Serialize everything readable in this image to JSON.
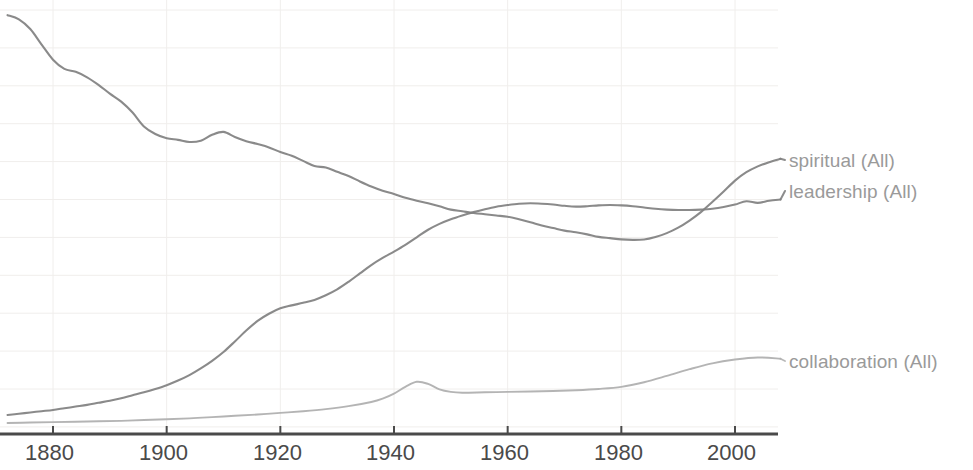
{
  "chart_data": {
    "type": "line",
    "title": "",
    "xlabel": "",
    "ylabel": "",
    "grid": true,
    "legend_position": "right-inline",
    "xlim": [
      1872,
      2008
    ],
    "ylim": [
      0,
      1.0
    ],
    "xticks": [
      "1880",
      "1900",
      "1920",
      "1940",
      "1960",
      "1980",
      "2000"
    ],
    "xtick_values": [
      1880,
      1900,
      1920,
      1940,
      1960,
      1980,
      2000
    ],
    "yticks": [],
    "series": [
      {
        "name": "spiritual (All)",
        "label": "spiritual (All)",
        "color": "#808080",
        "x": [
          1872,
          1874,
          1876,
          1878,
          1880,
          1882,
          1884,
          1886,
          1888,
          1890,
          1892,
          1894,
          1896,
          1898,
          1900,
          1902,
          1904,
          1906,
          1908,
          1910,
          1912,
          1914,
          1916,
          1918,
          1920,
          1922,
          1924,
          1926,
          1928,
          1930,
          1932,
          1934,
          1936,
          1938,
          1940,
          1942,
          1944,
          1946,
          1948,
          1950,
          1952,
          1954,
          1956,
          1958,
          1960,
          1962,
          1964,
          1966,
          1968,
          1970,
          1972,
          1974,
          1976,
          1978,
          1980,
          1982,
          1984,
          1986,
          1988,
          1990,
          1992,
          1994,
          1996,
          1998,
          2000,
          2002,
          2004,
          2006,
          2008
        ],
        "y": [
          0.983,
          0.973,
          0.95,
          0.913,
          0.877,
          0.855,
          0.848,
          0.835,
          0.817,
          0.796,
          0.777,
          0.751,
          0.718,
          0.7,
          0.69,
          0.686,
          0.681,
          0.684,
          0.698,
          0.705,
          0.693,
          0.683,
          0.676,
          0.668,
          0.657,
          0.648,
          0.636,
          0.624,
          0.62,
          0.61,
          0.6,
          0.587,
          0.575,
          0.565,
          0.557,
          0.548,
          0.541,
          0.535,
          0.528,
          0.52,
          0.516,
          0.512,
          0.509,
          0.506,
          0.503,
          0.497,
          0.49,
          0.482,
          0.476,
          0.47,
          0.466,
          0.461,
          0.455,
          0.452,
          0.449,
          0.448,
          0.449,
          0.455,
          0.464,
          0.477,
          0.494,
          0.514,
          0.538,
          0.563,
          0.589,
          0.609,
          0.623,
          0.633,
          0.641
        ]
      },
      {
        "name": "leadership (All)",
        "label": "leadership (All)",
        "color": "#808080",
        "x": [
          1872,
          1874,
          1876,
          1878,
          1880,
          1882,
          1884,
          1886,
          1888,
          1890,
          1892,
          1894,
          1896,
          1898,
          1900,
          1902,
          1904,
          1906,
          1908,
          1910,
          1912,
          1914,
          1916,
          1918,
          1920,
          1922,
          1924,
          1926,
          1928,
          1930,
          1932,
          1934,
          1936,
          1938,
          1940,
          1942,
          1944,
          1946,
          1948,
          1950,
          1952,
          1954,
          1956,
          1958,
          1960,
          1962,
          1964,
          1966,
          1968,
          1970,
          1972,
          1974,
          1976,
          1978,
          1980,
          1982,
          1984,
          1986,
          1988,
          1990,
          1992,
          1994,
          1996,
          1998,
          2000,
          2002,
          2004,
          2006,
          2008
        ],
        "y": [
          0.031,
          0.034,
          0.037,
          0.04,
          0.043,
          0.047,
          0.051,
          0.055,
          0.06,
          0.065,
          0.071,
          0.078,
          0.085,
          0.093,
          0.102,
          0.113,
          0.126,
          0.142,
          0.16,
          0.181,
          0.206,
          0.232,
          0.255,
          0.272,
          0.285,
          0.292,
          0.298,
          0.305,
          0.316,
          0.33,
          0.348,
          0.368,
          0.388,
          0.405,
          0.42,
          0.436,
          0.454,
          0.472,
          0.486,
          0.497,
          0.506,
          0.514,
          0.521,
          0.527,
          0.531,
          0.534,
          0.535,
          0.534,
          0.532,
          0.529,
          0.527,
          0.528,
          0.53,
          0.531,
          0.53,
          0.528,
          0.525,
          0.522,
          0.52,
          0.519,
          0.519,
          0.52,
          0.522,
          0.526,
          0.532,
          0.54,
          0.536,
          0.541,
          0.544
        ]
      },
      {
        "name": "collaboration (All)",
        "label": "collaboration (All)",
        "color": "#b0b0b0",
        "x": [
          1872,
          1876,
          1880,
          1884,
          1888,
          1892,
          1896,
          1900,
          1904,
          1908,
          1912,
          1916,
          1920,
          1924,
          1928,
          1932,
          1936,
          1938,
          1940,
          1942,
          1944,
          1946,
          1948,
          1950,
          1952,
          1956,
          1960,
          1964,
          1968,
          1972,
          1976,
          1980,
          1984,
          1988,
          1992,
          1996,
          2000,
          2004,
          2008
        ],
        "y": [
          0.012,
          0.013,
          0.014,
          0.015,
          0.016,
          0.017,
          0.019,
          0.021,
          0.023,
          0.026,
          0.029,
          0.032,
          0.036,
          0.04,
          0.045,
          0.052,
          0.062,
          0.07,
          0.082,
          0.098,
          0.11,
          0.105,
          0.092,
          0.086,
          0.084,
          0.085,
          0.086,
          0.087,
          0.088,
          0.09,
          0.093,
          0.098,
          0.109,
          0.124,
          0.14,
          0.154,
          0.163,
          0.168,
          0.165
        ]
      }
    ]
  },
  "axis": {
    "line_color": "#4a4a4a",
    "grid_color": "#f0eeec"
  },
  "legend": {
    "items": [
      {
        "label": "spiritual (All)"
      },
      {
        "label": "leadership (All)"
      },
      {
        "label": "collaboration (All)"
      }
    ]
  }
}
